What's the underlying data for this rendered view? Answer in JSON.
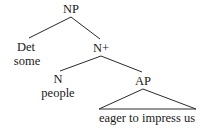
{
  "figure": {
    "type": "syntax-tree-diagram",
    "background_color": "#ffffff",
    "line_color": "#2a2a2a",
    "text_color": "#1a1a1a"
  },
  "nodes": {
    "root": {
      "label": "NP",
      "x": 71,
      "y": 3
    },
    "det": {
      "label": "Det",
      "x": 26,
      "y": 41
    },
    "nbar": {
      "label": "N+",
      "x": 101,
      "y": 42
    },
    "n": {
      "label": "N",
      "x": 58,
      "y": 73
    },
    "ap": {
      "label": "AP",
      "x": 143,
      "y": 75
    }
  },
  "terminals": {
    "det_word": {
      "label": "some",
      "x": 27,
      "y": 55
    },
    "n_word": {
      "label": "people",
      "x": 58,
      "y": 87
    },
    "ap_phrase": {
      "label": "eager to impress us",
      "x": 147,
      "y": 112
    }
  },
  "branches": [
    {
      "name": "np-to-det",
      "x1": 71,
      "y1": 17,
      "x2": 29,
      "y2": 38
    },
    {
      "name": "np-to-nbar",
      "x1": 71,
      "y1": 17,
      "x2": 100,
      "y2": 39
    },
    {
      "name": "nbar-to-n",
      "x1": 101,
      "y1": 56,
      "x2": 60,
      "y2": 71
    },
    {
      "name": "nbar-to-ap",
      "x1": 101,
      "y1": 56,
      "x2": 142,
      "y2": 72
    }
  ],
  "triangle": {
    "name": "ap-triangle",
    "apex_x": 143,
    "apex_y": 89,
    "left_x": 99,
    "right_x": 196,
    "base_y": 109
  }
}
